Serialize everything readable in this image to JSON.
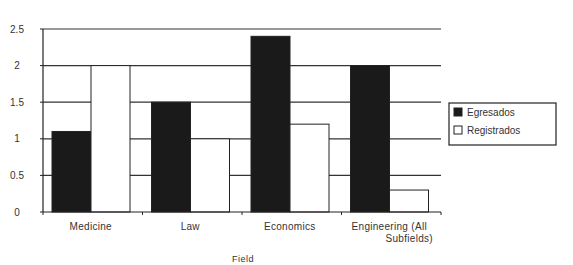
{
  "chart_data": {
    "type": "bar",
    "title": "",
    "xlabel": "Field",
    "ylabel": "",
    "categories": [
      "Medicine",
      "Law",
      "Economics",
      "Engineering (All Subfields)"
    ],
    "category_label_lines": [
      [
        "Medicine"
      ],
      [
        "Law"
      ],
      [
        "Economics"
      ],
      [
        "Engineering  (All",
        "Subfields)"
      ]
    ],
    "series": [
      {
        "name": "Egresados",
        "values": [
          1.1,
          1.5,
          2.4,
          2.0
        ],
        "color": "#1a1a1a"
      },
      {
        "name": "Registrados",
        "values": [
          2.0,
          1.0,
          1.2,
          0.3
        ],
        "color": "#ffffff"
      }
    ],
    "ylim": [
      0,
      2.5
    ],
    "yticks": [
      0,
      0.5,
      1,
      1.5,
      2,
      2.5
    ],
    "ytick_labels": [
      "0",
      "0.5",
      "1",
      "1.5",
      "2",
      "2.5"
    ],
    "grid": true,
    "legend_position": "right"
  }
}
